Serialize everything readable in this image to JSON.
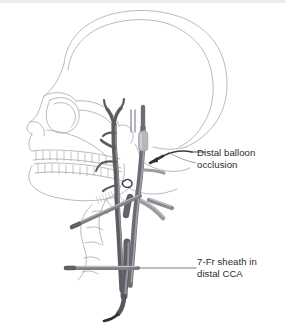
{
  "figure": {
    "background_color": "#ffffff",
    "top_strip_color": "#ececed",
    "width": 286,
    "height": 324
  },
  "annotations": [
    {
      "id": "distal-balloon-occlusion",
      "line1": "Distal balloon",
      "line2": "occlusion",
      "text_color": "#2b2b2b",
      "leader_color": "#3a3a3a",
      "pointer": "arrow"
    },
    {
      "id": "seven-fr-sheath",
      "line1": "7-Fr sheath in",
      "line2": "distal CCA",
      "text_color": "#2b2b2b",
      "leader_color": "#6b6b6b",
      "pointer": "line"
    }
  ],
  "anatomy": {
    "skull_outline_color": "#a8a8ac",
    "skull_detail_color": "#b8b8bc",
    "teeth_color": "#9e9ea2",
    "vessel_dark": "#5a5a60",
    "vessel_mid": "#6f6f76",
    "vessel_light": "#9a9aa0",
    "vessel_highlight": "#c2c2c8",
    "balloon_color": "#b4b4ba",
    "sheath_color": "#8c8c92",
    "device_tip_color": "#2f2f33",
    "parts": [
      "cranium",
      "orbit",
      "nasal-aperture",
      "maxilla",
      "mandible",
      "upper-teeth",
      "lower-teeth",
      "zygomatic-arch",
      "cervical-vertebrae",
      "common-carotid-artery",
      "internal-carotid-artery",
      "external-carotid-artery",
      "carotid-bifurcation",
      "carotid-branches",
      "occlusion-balloon",
      "guidewire",
      "arterial-sheath"
    ]
  }
}
